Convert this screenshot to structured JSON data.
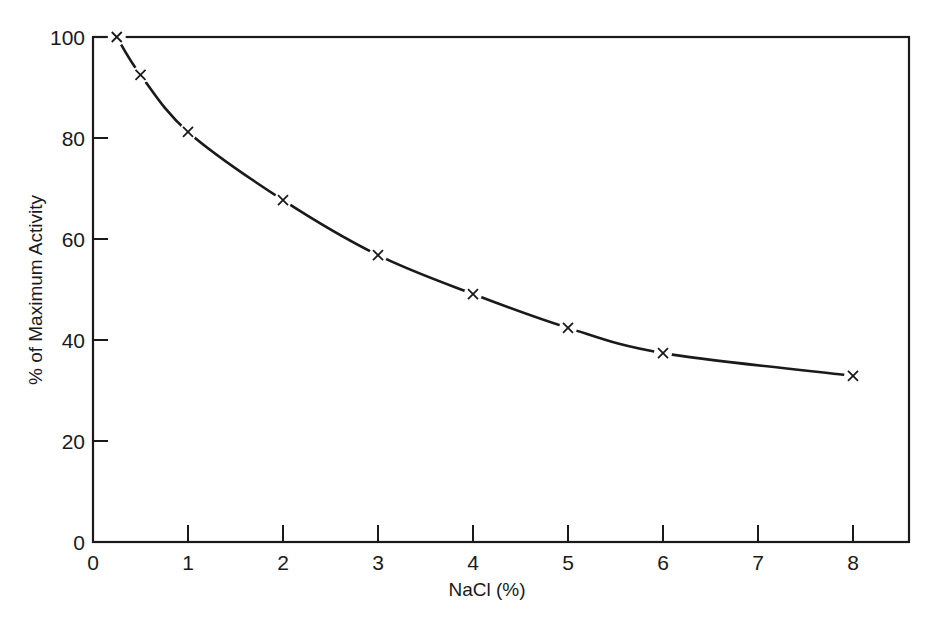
{
  "chart_data": {
    "type": "line",
    "title": "",
    "xlabel": "NaCl (%)",
    "ylabel": "% of Maximum Activity",
    "xlim": [
      0,
      8.6
    ],
    "ylim": [
      0,
      100
    ],
    "x_ticks": [
      "0",
      "1",
      "2",
      "3",
      "4",
      "5",
      "6",
      "7",
      "8"
    ],
    "y_ticks": [
      "0",
      "20",
      "40",
      "60",
      "80",
      "100"
    ],
    "grid": false,
    "legend": null,
    "marker": "x",
    "series": [
      {
        "name": "Activity",
        "x": [
          0.25,
          0.5,
          1,
          2,
          3,
          4,
          5,
          6,
          8
        ],
        "values": [
          100,
          92.5,
          81.2,
          67.7,
          56.8,
          49.1,
          42.4,
          37.4,
          32.9
        ]
      }
    ]
  },
  "colors": {
    "ink": "#1a1a1a",
    "background": "#ffffff"
  }
}
